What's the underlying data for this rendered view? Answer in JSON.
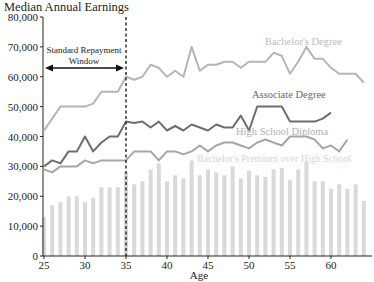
{
  "chart_data": {
    "type": "line",
    "title": "Median Annual Earnings",
    "xlabel": "Age",
    "ylabel": "Median Annual Earnings",
    "ylim": [
      0,
      80000
    ],
    "xlim": [
      25,
      65
    ],
    "yticks": [
      0,
      10000,
      20000,
      30000,
      40000,
      50000,
      60000,
      70000,
      80000
    ],
    "ytick_labels": [
      "0",
      "10,000",
      "20,000",
      "30,000",
      "40,000",
      "50,000",
      "60,000",
      "70,000",
      "80,000"
    ],
    "xticks": [
      25,
      30,
      35,
      40,
      45,
      50,
      55,
      60
    ],
    "xtick_labels": [
      "25",
      "30",
      "35",
      "40",
      "45",
      "50",
      "55",
      "60"
    ],
    "grid": false,
    "x": [
      25,
      26,
      27,
      28,
      29,
      30,
      31,
      32,
      33,
      34,
      35,
      36,
      37,
      38,
      39,
      40,
      41,
      42,
      43,
      44,
      45,
      46,
      47,
      48,
      49,
      50,
      51,
      52,
      53,
      54,
      55,
      56,
      57,
      58,
      59,
      60,
      61,
      62,
      63,
      64
    ],
    "series": [
      {
        "name": "Bachelor's Degree",
        "type": "line",
        "color": "#b5b5b5",
        "values": [
          42000,
          46000,
          50000,
          50000,
          50000,
          50000,
          51000,
          55000,
          55000,
          55000,
          60000,
          59000,
          60000,
          64000,
          63000,
          60000,
          62000,
          60000,
          70000,
          62000,
          64000,
          64000,
          65000,
          65000,
          63000,
          65000,
          65000,
          65000,
          68000,
          67000,
          61000,
          65000,
          70000,
          66000,
          66000,
          63000,
          61000,
          61000,
          61000,
          58000
        ]
      },
      {
        "name": "Associate Degree",
        "type": "line",
        "color": "#6e6e6e",
        "values": [
          30000,
          32000,
          31000,
          35000,
          35000,
          40000,
          35000,
          38000,
          40000,
          40000,
          45000,
          44500,
          45000,
          43000,
          45000,
          42000,
          43500,
          42000,
          44000,
          43000,
          42000,
          44000,
          43000,
          43000,
          47000,
          42000,
          50000,
          50000,
          50000,
          50000,
          45000,
          45000,
          45000,
          45000,
          46000,
          48000,
          null,
          null,
          null,
          null
        ]
      },
      {
        "name": "High School Diploma",
        "type": "line",
        "color": "#a6a6a6",
        "values": [
          29000,
          28000,
          30000,
          30000,
          30000,
          32000,
          31000,
          32000,
          32000,
          32000,
          32000,
          35000,
          35000,
          35000,
          32000,
          35000,
          35000,
          34000,
          35000,
          37000,
          35000,
          37000,
          38000,
          38000,
          37000,
          36000,
          38000,
          39000,
          38000,
          37000,
          40000,
          40000,
          40000,
          39000,
          36000,
          37000,
          35000,
          39000,
          null,
          null
        ]
      },
      {
        "name": "Bachelor's Premium over High School",
        "type": "bar",
        "color": "#d9d9d9",
        "values": [
          13000,
          17000,
          18000,
          20000,
          20000,
          18000,
          19500,
          23000,
          23000,
          23000,
          28000,
          24000,
          25000,
          29000,
          31000,
          25000,
          27000,
          26000,
          32000,
          27000,
          29000,
          28000,
          27000,
          30000,
          26000,
          28500,
          27000,
          26500,
          29000,
          29500,
          25500,
          29000,
          31500,
          25000,
          25000,
          22500,
          24000,
          22500,
          24000,
          18500
        ]
      }
    ],
    "annotations": [
      {
        "text_line1": "Standard Repayment",
        "text_line2": "Window",
        "x_from": 25,
        "x_to": 35,
        "y": 63000
      },
      {
        "type": "vline",
        "x": 35,
        "style": "dashed"
      }
    ],
    "series_labels": {
      "bachelors": "Bachelor's Degree",
      "associate": "Associate Degree",
      "highschool": "High School Diploma",
      "premium": "Bachelor's Premium over High School"
    }
  }
}
